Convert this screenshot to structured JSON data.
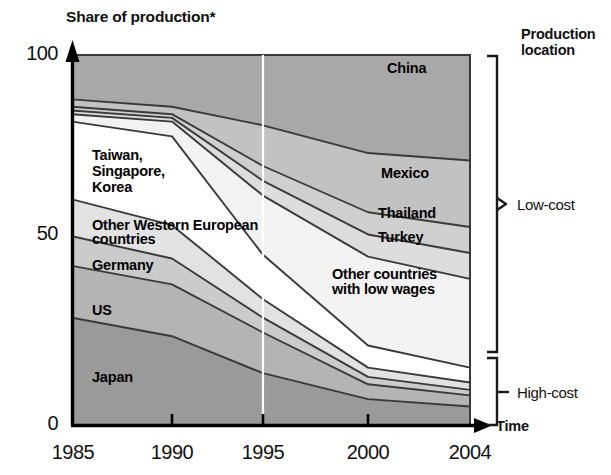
{
  "chart_data": {
    "type": "area",
    "title": "Share of production*",
    "xlabel": "Time",
    "ylabel": "Share of production*",
    "ylim": [
      0,
      100
    ],
    "yticks": [
      0,
      50,
      100
    ],
    "x": [
      1985,
      1990,
      1995,
      2000,
      2004
    ],
    "xtick_labels": [
      "1985",
      "1990",
      "1995",
      "2000",
      "2004"
    ],
    "grid": false,
    "legend": "inline-band-labels",
    "stacked": true,
    "stack_order_bottom_to_top": [
      "Japan",
      "US",
      "Germany",
      "Other Western European countries",
      "Taiwan, Singapore, Korea",
      "Other countries with low wages",
      "Turkey",
      "Thailand",
      "Mexico",
      "China"
    ],
    "series": [
      {
        "name": "Japan",
        "color": "#9a9a9a",
        "values": [
          29,
          24,
          14,
          7,
          5
        ]
      },
      {
        "name": "US",
        "color": "#b4b4b4",
        "values": [
          14,
          14,
          11,
          4,
          3
        ]
      },
      {
        "name": "Germany",
        "color": "#cbcbcb",
        "values": [
          8,
          7,
          4,
          2,
          1.5
        ]
      },
      {
        "name": "Other Western European countries",
        "color": "#e2e2e2",
        "values": [
          10,
          9,
          5,
          2.5,
          2
        ]
      },
      {
        "name": "Taiwan, Singapore, Korea",
        "color": "#ffffff",
        "values": [
          21,
          24,
          12,
          6,
          4
        ]
      },
      {
        "name": "Other countries with low wages",
        "color": "#f2f2f2",
        "values": [
          2,
          4,
          16,
          24,
          24
        ]
      },
      {
        "name": "Turkey",
        "color": "#dddddd",
        "values": [
          1,
          1,
          4,
          6,
          7
        ]
      },
      {
        "name": "Thailand",
        "color": "#cfcfcf",
        "values": [
          1,
          1,
          4,
          6,
          7
        ]
      },
      {
        "name": "Mexico",
        "color": "#c2c2c2",
        "values": [
          2,
          2,
          11,
          16,
          18
        ]
      },
      {
        "name": "China",
        "color": "#a8a8a8",
        "values": [
          12,
          14,
          19,
          26.5,
          28.5
        ]
      }
    ],
    "cumulative_tops": {
      "Japan": [
        29,
        24,
        14,
        7,
        5
      ],
      "US": [
        43,
        38,
        25,
        11,
        8
      ],
      "Germany": [
        51,
        45,
        29,
        13,
        9.5
      ],
      "Other Western European countries": [
        61,
        54,
        34,
        15.5,
        11.5
      ],
      "Taiwan, Singapore, Korea": [
        82,
        78,
        46,
        21.5,
        15.5
      ],
      "Other countries with low wages": [
        84,
        82,
        62,
        45.5,
        39.5
      ],
      "Turkey": [
        85,
        83,
        66,
        51.5,
        46.5
      ],
      "Thailand": [
        86,
        84,
        70,
        57.5,
        53.5
      ],
      "Mexico": [
        88,
        86,
        81,
        73.5,
        71.5
      ],
      "China": [
        100,
        100,
        100,
        100,
        100
      ]
    },
    "annotations": [
      {
        "text": "China",
        "x": 2001,
        "y": 92
      },
      {
        "text": "Mexico",
        "x": 2000,
        "y": 61
      },
      {
        "text": "Thailand",
        "x": 1999,
        "y": 50
      },
      {
        "text": "Turkey",
        "x": 1999,
        "y": 43
      },
      {
        "text": "Other countries\nwith low wages",
        "x": 1999,
        "y": 32
      },
      {
        "text": "Taiwan,\nSingapore,\nKorea",
        "x": 1986,
        "y": 66
      },
      {
        "text": "Other Western European\ncountries",
        "x": 1986,
        "y": 51
      },
      {
        "text": "Germany",
        "x": 1986,
        "y": 42
      },
      {
        "text": "US",
        "x": 1986,
        "y": 31
      },
      {
        "text": "Japan",
        "x": 1986,
        "y": 16
      }
    ]
  },
  "labels": {
    "y_axis_title": "Share of production*",
    "x_axis_title": "Time",
    "y_100": "100",
    "y_50": "50",
    "y_0": "0",
    "x_1985": "1985",
    "x_1990": "1990",
    "x_1995": "1995",
    "x_2000": "2000",
    "x_2004": "2004",
    "band_china": "China",
    "band_mexico": "Mexico",
    "band_thailand": "Thailand",
    "band_turkey": "Turkey",
    "band_other_low_wages_l1": "Other countries",
    "band_other_low_wages_l2": "with low wages",
    "band_taiwan_l1": "Taiwan,",
    "band_taiwan_l2": "Singapore,",
    "band_taiwan_l3": "Korea",
    "band_other_weu_l1": "Other Western European",
    "band_other_weu_l2": "countries",
    "band_germany": "Germany",
    "band_us": "US",
    "band_japan": "Japan"
  },
  "legend": {
    "title_l1": "Production",
    "title_l2": "location",
    "low_cost": "Low-cost",
    "high_cost": "High-cost"
  },
  "colors": {
    "japan": "#9a9a9a",
    "us": "#b4b4b4",
    "germany": "#cbcbcb",
    "other_weu": "#e2e2e2",
    "taiwan": "#ffffff",
    "other_low": "#f2f2f2",
    "turkey": "#dddddd",
    "thailand": "#cfcfcf",
    "mexico": "#c2c2c2",
    "china": "#a8a8a8",
    "stroke": "#3a3a3a",
    "axis": "#000000"
  }
}
